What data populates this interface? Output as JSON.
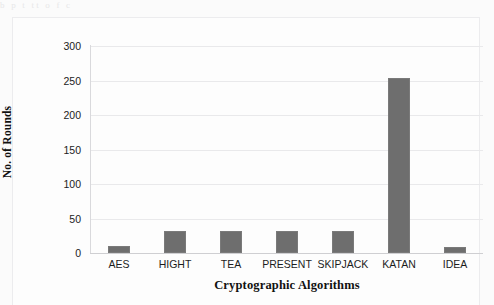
{
  "scan_artifact": {
    "top_bleed_text": "b                                   p                 t                                   tt   o  f             c"
  },
  "chart_data": {
    "type": "bar",
    "title": "",
    "categories": [
      "AES",
      "HIGHT",
      "TEA",
      "PRESENT",
      "SKIPJACK",
      "KATAN",
      "IDEA"
    ],
    "values": [
      10,
      32,
      32,
      32,
      32,
      254,
      8.5
    ],
    "xlabel": "Cryptographic Algorithms",
    "ylabel": "No. of Rounds",
    "ylim": [
      0,
      300
    ],
    "yticks": [
      0,
      50,
      100,
      150,
      200,
      250,
      300
    ],
    "ytick_labels": [
      "0",
      "50",
      "100",
      "150",
      "200",
      "250",
      "300"
    ],
    "grid": true,
    "grid_axis": "y",
    "legend": false,
    "legend_position": "none",
    "bar_color": "#6e6e6e",
    "gridline_color": "#e9e9eb",
    "frame_color": "#ececee",
    "background_color": "#fdfdfd"
  }
}
